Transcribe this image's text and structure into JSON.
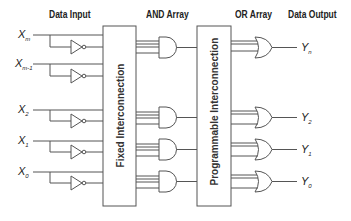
{
  "headers": {
    "data_input": "Data Input",
    "and_array": "AND Array",
    "or_array": "OR Array",
    "data_output": "Data Output"
  },
  "blocks": {
    "fixed": "Fixed Interconnection",
    "programmable": "Programmable Interconnection"
  },
  "inputs": [
    {
      "base": "X",
      "sub": "m"
    },
    {
      "base": "X",
      "sub": "m-1"
    },
    {
      "base": "X",
      "sub": "2"
    },
    {
      "base": "X",
      "sub": "1"
    },
    {
      "base": "X",
      "sub": "0"
    }
  ],
  "outputs": [
    {
      "base": "Y",
      "sub": "n"
    },
    {
      "base": "Y",
      "sub": "2"
    },
    {
      "base": "Y",
      "sub": "1"
    },
    {
      "base": "Y",
      "sub": "0"
    }
  ],
  "colors": {
    "line": "#555555",
    "text": "#222222"
  }
}
